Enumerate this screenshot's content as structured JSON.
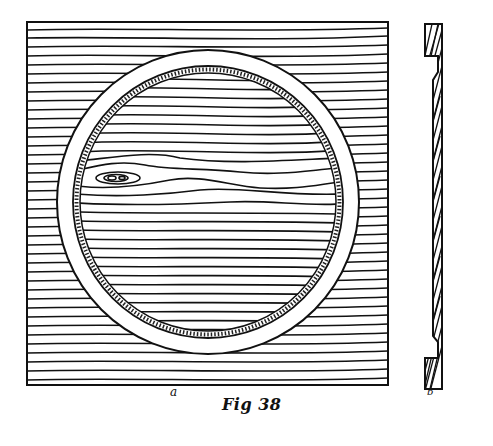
{
  "figure": {
    "caption": "Fig 38",
    "subfigure_labels": {
      "front_view": "a",
      "section_view": "b"
    },
    "ink_color": "#111111",
    "paper_color": "#ffffff"
  }
}
